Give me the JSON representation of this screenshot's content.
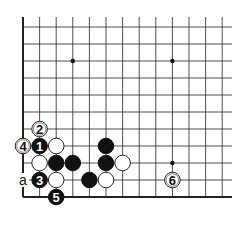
{
  "diagram": {
    "type": "go-board-fragment",
    "grid": {
      "origin_x": 23,
      "origin_y": 10,
      "spacing_x": 16.6,
      "spacing_y": 17,
      "cols": 13,
      "rows": 12,
      "right_extent": 232,
      "top_open": true
    },
    "star_points": [
      {
        "col": 3,
        "row": 3
      },
      {
        "col": 9,
        "row": 3
      },
      {
        "col": 9,
        "row": 9
      }
    ],
    "stones": [
      {
        "color": "white",
        "col": 1,
        "row": 7,
        "label": "2"
      },
      {
        "color": "black",
        "col": 1,
        "row": 8,
        "label": "1"
      },
      {
        "color": "white",
        "col": 0,
        "row": 8,
        "label": "4"
      },
      {
        "color": "white",
        "col": 2,
        "row": 8,
        "label": ""
      },
      {
        "color": "black",
        "col": 5,
        "row": 8,
        "label": ""
      },
      {
        "color": "white",
        "col": 1,
        "row": 9,
        "label": ""
      },
      {
        "color": "black",
        "col": 2,
        "row": 9,
        "label": ""
      },
      {
        "color": "black",
        "col": 3,
        "row": 9,
        "label": ""
      },
      {
        "color": "black",
        "col": 5,
        "row": 9,
        "label": ""
      },
      {
        "color": "white",
        "col": 6,
        "row": 9,
        "label": ""
      },
      {
        "color": "black",
        "col": 1,
        "row": 10,
        "label": "3"
      },
      {
        "color": "white",
        "col": 2,
        "row": 10,
        "label": ""
      },
      {
        "color": "black",
        "col": 4,
        "row": 10,
        "label": ""
      },
      {
        "color": "white",
        "col": 5,
        "row": 10,
        "label": ""
      },
      {
        "color": "black",
        "col": 2,
        "row": 11,
        "label": "5"
      },
      {
        "color": "white",
        "col": 9,
        "row": 10,
        "label": "6"
      }
    ],
    "markers": [
      {
        "text": "a",
        "col": 0,
        "row": 10
      }
    ]
  }
}
